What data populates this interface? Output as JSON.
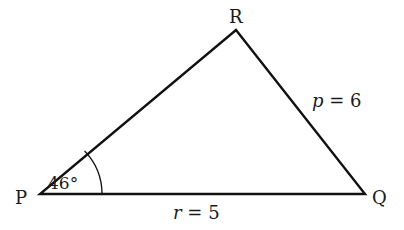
{
  "diagram": {
    "type": "triangle",
    "stroke_color": "#111111",
    "vertices": [
      {
        "name": "P",
        "x": 40,
        "y": 194
      },
      {
        "name": "Q",
        "x": 365,
        "y": 194
      },
      {
        "name": "R",
        "x": 236,
        "y": 30
      }
    ],
    "labels": {
      "P": "P",
      "Q": "Q",
      "R": "R"
    },
    "sides": {
      "p": {
        "var": "p",
        "eq": " = 6",
        "opposite": "P"
      },
      "r": {
        "var": "r",
        "eq": " = 5",
        "opposite": "R"
      }
    },
    "angle": {
      "vertex": "P",
      "value": "46°"
    }
  }
}
